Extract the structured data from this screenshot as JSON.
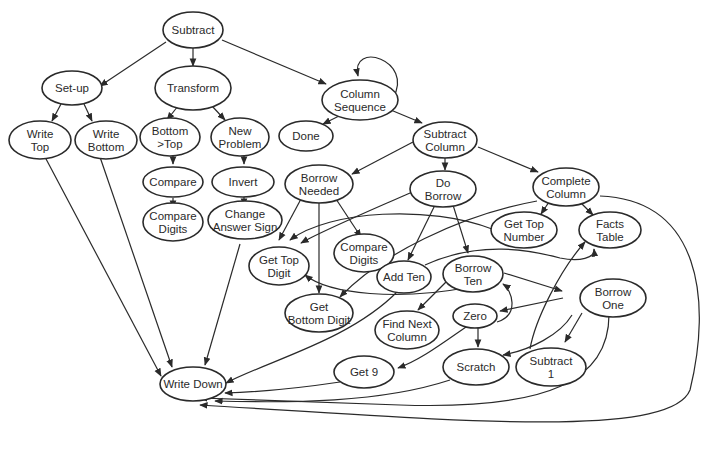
{
  "diagram": {
    "type": "directed-graph",
    "colors": {
      "stroke": "#2a2a2a",
      "background": "#ffffff"
    },
    "nodes": [
      {
        "id": "subtract",
        "label": [
          "Subtract"
        ]
      },
      {
        "id": "setup",
        "label": [
          "Set-up"
        ]
      },
      {
        "id": "transform",
        "label": [
          "Transform"
        ]
      },
      {
        "id": "column_sequence",
        "label": [
          "Column",
          "Sequence"
        ]
      },
      {
        "id": "write_top",
        "label": [
          "Write",
          "Top"
        ]
      },
      {
        "id": "write_bottom",
        "label": [
          "Write",
          "Bottom"
        ]
      },
      {
        "id": "bottom_gt_top",
        "label": [
          "Bottom",
          ">Top"
        ]
      },
      {
        "id": "new_problem",
        "label": [
          "New",
          "Problem"
        ]
      },
      {
        "id": "done",
        "label": [
          "Done"
        ]
      },
      {
        "id": "subtract_column",
        "label": [
          "Subtract",
          "Column"
        ]
      },
      {
        "id": "compare",
        "label": [
          "Compare"
        ]
      },
      {
        "id": "invert",
        "label": [
          "Invert"
        ]
      },
      {
        "id": "borrow_needed",
        "label": [
          "Borrow",
          "Needed"
        ]
      },
      {
        "id": "do_borrow",
        "label": [
          "Do",
          "Borrow"
        ]
      },
      {
        "id": "complete_column",
        "label": [
          "Complete",
          "Column"
        ]
      },
      {
        "id": "compare_digits_1",
        "label": [
          "Compare",
          "Digits"
        ]
      },
      {
        "id": "change_answer_sign",
        "label": [
          "Change",
          "Answer Sign"
        ]
      },
      {
        "id": "get_top_number",
        "label": [
          "Get Top",
          "Number"
        ]
      },
      {
        "id": "facts_table",
        "label": [
          "Facts",
          "Table"
        ]
      },
      {
        "id": "compare_digits_2",
        "label": [
          "Compare",
          "Digits"
        ]
      },
      {
        "id": "get_top_digit",
        "label": [
          "Get Top",
          "Digit"
        ]
      },
      {
        "id": "add_ten",
        "label": [
          "Add Ten"
        ]
      },
      {
        "id": "borrow_ten",
        "label": [
          "Borrow",
          "Ten"
        ]
      },
      {
        "id": "get_bottom_digit",
        "label": [
          "Get",
          "Bottom Digit"
        ]
      },
      {
        "id": "borrow_one",
        "label": [
          "Borrow",
          "One"
        ]
      },
      {
        "id": "zero",
        "label": [
          "Zero"
        ]
      },
      {
        "id": "find_next_column",
        "label": [
          "Find Next",
          "Column"
        ]
      },
      {
        "id": "get_9",
        "label": [
          "Get 9"
        ]
      },
      {
        "id": "scratch",
        "label": [
          "Scratch"
        ]
      },
      {
        "id": "subtract_1",
        "label": [
          "Subtract",
          "1"
        ]
      },
      {
        "id": "write_down",
        "label": [
          "Write Down"
        ]
      }
    ],
    "edges": [
      [
        "subtract",
        "setup"
      ],
      [
        "subtract",
        "transform"
      ],
      [
        "subtract",
        "column_sequence"
      ],
      [
        "column_sequence",
        "column_sequence"
      ],
      [
        "column_sequence",
        "done"
      ],
      [
        "column_sequence",
        "subtract_column"
      ],
      [
        "setup",
        "write_top"
      ],
      [
        "setup",
        "write_bottom"
      ],
      [
        "transform",
        "bottom_gt_top"
      ],
      [
        "transform",
        "new_problem"
      ],
      [
        "bottom_gt_top",
        "compare"
      ],
      [
        "compare",
        "compare_digits_1"
      ],
      [
        "new_problem",
        "invert"
      ],
      [
        "invert",
        "change_answer_sign"
      ],
      [
        "subtract_column",
        "borrow_needed"
      ],
      [
        "subtract_column",
        "do_borrow"
      ],
      [
        "subtract_column",
        "complete_column"
      ],
      [
        "borrow_needed",
        "get_top_digit"
      ],
      [
        "borrow_needed",
        "get_bottom_digit"
      ],
      [
        "borrow_needed",
        "compare_digits_2"
      ],
      [
        "do_borrow",
        "get_top_digit"
      ],
      [
        "do_borrow",
        "add_ten"
      ],
      [
        "do_borrow",
        "borrow_ten"
      ],
      [
        "complete_column",
        "get_top_number"
      ],
      [
        "complete_column",
        "facts_table"
      ],
      [
        "complete_column",
        "get_bottom_digit"
      ],
      [
        "complete_column",
        "write_down"
      ],
      [
        "get_top_number",
        "get_top_digit"
      ],
      [
        "borrow_ten",
        "get_top_digit"
      ],
      [
        "borrow_ten",
        "find_next_column"
      ],
      [
        "borrow_ten",
        "borrow_one"
      ],
      [
        "add_ten",
        "facts_table"
      ],
      [
        "add_ten",
        "write_down"
      ],
      [
        "borrow_one",
        "zero"
      ],
      [
        "borrow_one",
        "scratch"
      ],
      [
        "borrow_one",
        "subtract_1"
      ],
      [
        "borrow_one",
        "write_down"
      ],
      [
        "zero",
        "borrow_ten"
      ],
      [
        "zero",
        "scratch"
      ],
      [
        "zero",
        "get_9"
      ],
      [
        "subtract_1",
        "facts_table"
      ],
      [
        "get_9",
        "write_down"
      ],
      [
        "scratch",
        "write_down"
      ],
      [
        "write_top",
        "write_down"
      ],
      [
        "write_bottom",
        "write_down"
      ],
      [
        "change_answer_sign",
        "write_down"
      ]
    ]
  }
}
